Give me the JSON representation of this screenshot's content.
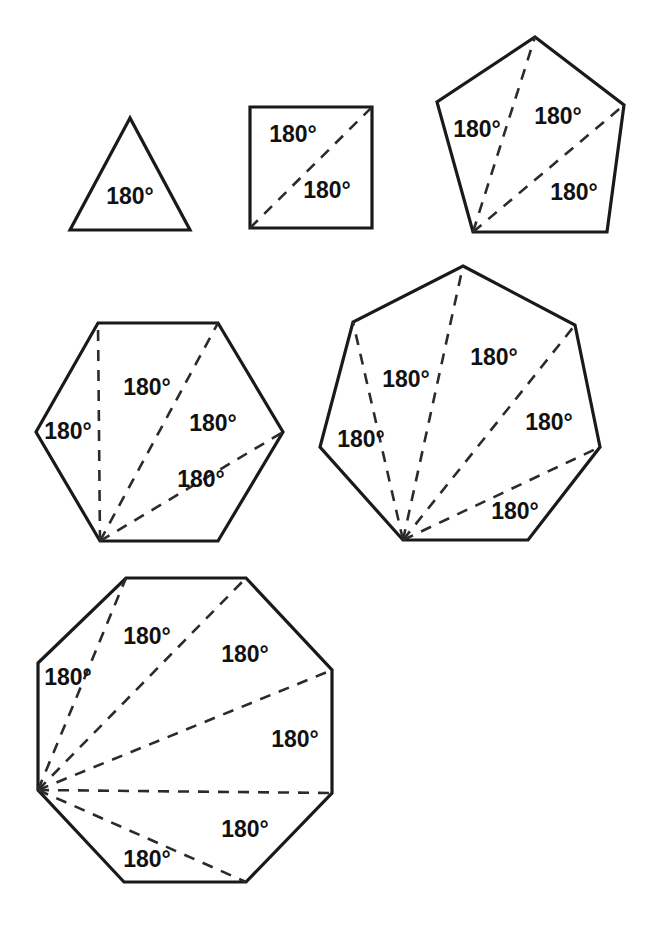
{
  "figure": {
    "background": "#ffffff",
    "stroke_color": "#1a1a1a",
    "dash_color": "#2b2b2b",
    "label_color": "#111111",
    "label_text": "180°",
    "polygons": [
      {
        "name": "triangle",
        "sides": 3,
        "triangle_count": 1,
        "vertices": [
          [
            130,
            118
          ],
          [
            70,
            230
          ],
          [
            190,
            230
          ]
        ],
        "fan_vertex_index": 1,
        "diagonals": [],
        "labels": [
          {
            "text": "180°",
            "x": 130,
            "y": 198
          }
        ]
      },
      {
        "name": "square",
        "sides": 4,
        "triangle_count": 2,
        "vertices": [
          [
            250,
            107
          ],
          [
            372,
            107
          ],
          [
            372,
            228
          ],
          [
            250,
            228
          ]
        ],
        "fan_vertex_index": 3,
        "diagonals": [
          [
            [
              250,
              228
            ],
            [
              372,
              107
            ]
          ]
        ],
        "labels": [
          {
            "text": "180°",
            "x": 293,
            "y": 136
          },
          {
            "text": "180°",
            "x": 327,
            "y": 192
          }
        ]
      },
      {
        "name": "pentagon",
        "sides": 5,
        "triangle_count": 3,
        "vertices": [
          [
            535,
            37
          ],
          [
            624,
            105
          ],
          [
            607,
            232
          ],
          [
            473,
            232
          ],
          [
            437,
            102
          ]
        ],
        "fan_vertex_index": 3,
        "diagonals": [
          [
            [
              473,
              232
            ],
            [
              535,
              37
            ]
          ],
          [
            [
              473,
              232
            ],
            [
              624,
              105
            ]
          ]
        ],
        "labels": [
          {
            "text": "180°",
            "x": 477,
            "y": 131
          },
          {
            "text": "180°",
            "x": 558,
            "y": 118
          },
          {
            "text": "180°",
            "x": 574,
            "y": 194
          }
        ]
      },
      {
        "name": "hexagon",
        "sides": 6,
        "triangle_count": 4,
        "vertices": [
          [
            98,
            323
          ],
          [
            218,
            323
          ],
          [
            283,
            432
          ],
          [
            218,
            541
          ],
          [
            100,
            541
          ],
          [
            36,
            432
          ]
        ],
        "fan_vertex_index": 4,
        "diagonals": [
          [
            [
              100,
              541
            ],
            [
              98,
              323
            ]
          ],
          [
            [
              100,
              541
            ],
            [
              218,
              323
            ]
          ],
          [
            [
              100,
              541
            ],
            [
              283,
              432
            ]
          ]
        ],
        "labels": [
          {
            "text": "180°",
            "x": 68,
            "y": 433
          },
          {
            "text": "180°",
            "x": 147,
            "y": 389
          },
          {
            "text": "180°",
            "x": 213,
            "y": 425
          },
          {
            "text": "180°",
            "x": 201,
            "y": 481
          }
        ]
      },
      {
        "name": "heptagon",
        "sides": 7,
        "triangle_count": 5,
        "vertices": [
          [
            463,
            266
          ],
          [
            575,
            325
          ],
          [
            600,
            447
          ],
          [
            528,
            540
          ],
          [
            403,
            540
          ],
          [
            320,
            447
          ],
          [
            353,
            322
          ]
        ],
        "fan_vertex_index": 4,
        "diagonals": [
          [
            [
              403,
              540
            ],
            [
              353,
              322
            ]
          ],
          [
            [
              403,
              540
            ],
            [
              463,
              266
            ]
          ],
          [
            [
              403,
              540
            ],
            [
              575,
              325
            ]
          ],
          [
            [
              403,
              540
            ],
            [
              600,
              447
            ]
          ]
        ],
        "labels": [
          {
            "text": "180°",
            "x": 361,
            "y": 441
          },
          {
            "text": "180°",
            "x": 406,
            "y": 381
          },
          {
            "text": "180°",
            "x": 494,
            "y": 359
          },
          {
            "text": "180°",
            "x": 549,
            "y": 424
          },
          {
            "text": "180°",
            "x": 515,
            "y": 513
          }
        ]
      },
      {
        "name": "octagon",
        "sides": 8,
        "triangle_count": 6,
        "vertices": [
          [
            126,
            578
          ],
          [
            246,
            578
          ],
          [
            332,
            670
          ],
          [
            332,
            793
          ],
          [
            246,
            882
          ],
          [
            124,
            882
          ],
          [
            38,
            790
          ],
          [
            38,
            663
          ]
        ],
        "fan_vertex_index": 6,
        "diagonals": [
          [
            [
              38,
              790
            ],
            [
              126,
              578
            ]
          ],
          [
            [
              38,
              790
            ],
            [
              246,
              578
            ]
          ],
          [
            [
              38,
              790
            ],
            [
              332,
              670
            ]
          ],
          [
            [
              38,
              790
            ],
            [
              332,
              793
            ]
          ],
          [
            [
              38,
              790
            ],
            [
              246,
              882
            ]
          ]
        ],
        "labels": [
          {
            "text": "180°",
            "x": 68,
            "y": 679
          },
          {
            "text": "180°",
            "x": 147,
            "y": 638
          },
          {
            "text": "180°",
            "x": 245,
            "y": 656
          },
          {
            "text": "180°",
            "x": 295,
            "y": 741
          },
          {
            "text": "180°",
            "x": 245,
            "y": 831
          },
          {
            "text": "180°",
            "x": 147,
            "y": 861
          }
        ]
      }
    ]
  }
}
